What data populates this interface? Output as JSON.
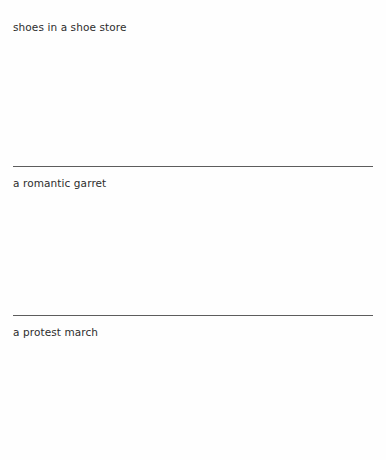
{
  "document": {
    "background_color": "#fefefe",
    "text_color": "#2d2d2d",
    "rule_color": "#5d5d5d",
    "entries": [
      {
        "caption": "shoes in a shoe store",
        "has_rule_above": false
      },
      {
        "caption": "a romantic garret",
        "has_rule_above": true
      },
      {
        "caption": "a protest march",
        "has_rule_above": true
      }
    ]
  }
}
